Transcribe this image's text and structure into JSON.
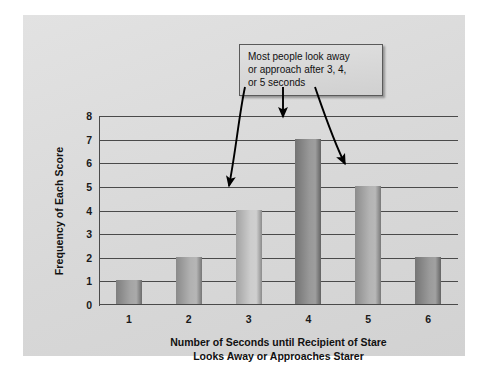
{
  "chart_data": {
    "type": "bar",
    "title": "",
    "subtitle": "",
    "categories": [
      "1",
      "2",
      "3",
      "4",
      "5",
      "6"
    ],
    "values": [
      1,
      2,
      4,
      7,
      5,
      2
    ],
    "xlabel": "Number of Seconds until Recipient of Stare Looks Away or Approaches Starer",
    "xlabel_line1": "Number of Seconds until Recipient of Stare",
    "xlabel_line2": "Looks Away or Approaches Starer",
    "ylabel": "Frequency of Each Score",
    "ylim": [
      0,
      8
    ],
    "yticks": [
      0,
      1,
      2,
      3,
      4,
      5,
      6,
      7,
      8
    ],
    "grid": "horizontal",
    "legend": "none",
    "bar_colors": [
      "#9a9a9a",
      "#a8a8a8",
      "#c6c6c6",
      "#8c8c8c",
      "#ababab",
      "#8f8f8f"
    ],
    "annotations": [
      {
        "text": "Most people look away or approach after 3, 4, or 5 seconds",
        "line1": "Most people look away",
        "line2": "or approach after 3, 4,",
        "line3": "or 5 seconds",
        "points_to": [
          "3",
          "4",
          "5"
        ]
      }
    ]
  },
  "colors": {
    "panel_background": "#dcdcdc",
    "page_background": "#ffffff",
    "axis": "#4a4a4a",
    "text": "#111111",
    "callout_background": "#d4d4d4",
    "callout_border": "#5a5a5a",
    "arrow": "#000000"
  }
}
